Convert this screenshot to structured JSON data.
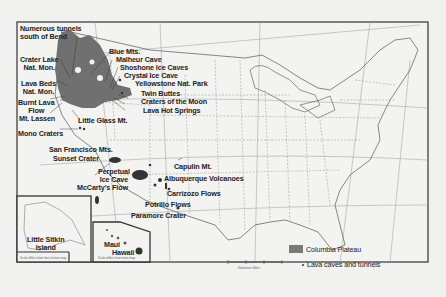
{
  "map": {
    "title": "Lava caves and volcanic features of the United States",
    "labels": [
      {
        "id": "numerous-tunnels",
        "text": "Numerous tunnels\nsouth of Bend"
      },
      {
        "id": "crater-lake",
        "text": "Crater Lake\nNat. Mon."
      },
      {
        "id": "lava-beds",
        "text": "Lava Beds\nNat. Mon."
      },
      {
        "id": "burnt-lava-flow",
        "text": "Burnt Lava\nFlow"
      },
      {
        "id": "mt-lassen",
        "text": "Mt. Lassen"
      },
      {
        "id": "mono-craters",
        "text": "Mono Craters"
      },
      {
        "id": "blue-mts",
        "text": "Blue Mts."
      },
      {
        "id": "malheur-cave",
        "text": "Malheur Cave"
      },
      {
        "id": "shoshone-ice-caves",
        "text": "Shoshone Ice Caves"
      },
      {
        "id": "crystal-ice-cave",
        "text": "Crystal Ice Cave"
      },
      {
        "id": "yellowstone",
        "text": "Yellowstone Nat. Park"
      },
      {
        "id": "twin-buttes",
        "text": "Twin Buttes"
      },
      {
        "id": "craters-of-the-moon",
        "text": "Craters of the Moon"
      },
      {
        "id": "lava-hot-springs",
        "text": "Lava Hot Springs"
      },
      {
        "id": "little-glass-mt",
        "text": "Little Glass Mt."
      },
      {
        "id": "san-francisco-mts",
        "text": "San Francisco Mts."
      },
      {
        "id": "sunset-crater",
        "text": "Sunset Crater"
      },
      {
        "id": "perpetual-ice-cave",
        "text": "Perpetual\nIce Cave"
      },
      {
        "id": "mccartys-flow",
        "text": "McCarty's Flow"
      },
      {
        "id": "capulin-mt",
        "text": "Capulin Mt."
      },
      {
        "id": "albuquerque-volcanoes",
        "text": "Albuquerque Volcanoes"
      },
      {
        "id": "carrizozo-flows",
        "text": "Carrizozo Flows"
      },
      {
        "id": "potrillo-flows",
        "text": "Potrillo Flows"
      },
      {
        "id": "paramore-crater",
        "text": "Paramore Crater"
      },
      {
        "id": "little-sitkin-island",
        "text": "Little Sitkin\nIsland"
      },
      {
        "id": "maui",
        "text": "Maui"
      },
      {
        "id": "hawaii",
        "text": "Hawaii"
      }
    ],
    "legend": {
      "plateau_label": "Columbia Plateau",
      "caves_label": "Lava caves and tunnels"
    },
    "scale_label": "Kilometers  Miles",
    "inset_captions": {
      "alaska": "Scale differs from that of main map",
      "hawaii": "Scale differs from main map"
    },
    "colors": {
      "plateau": "#6f6f6f",
      "background": "#f1f1ef",
      "border": "#333333"
    }
  }
}
